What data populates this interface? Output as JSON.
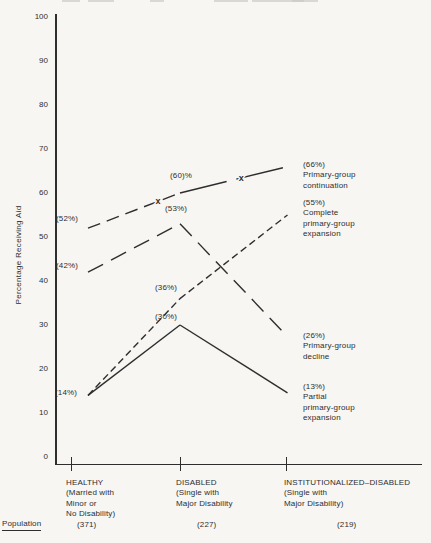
{
  "colors": {
    "ink": "#2e2e2e",
    "paper": "#f7f6f3"
  },
  "chart_data": {
    "type": "line",
    "title": "",
    "xlabel": "",
    "ylabel": "Percentage Receiving Aid",
    "ylim": [
      0,
      100
    ],
    "grid": false,
    "legend_position": "right-of-line-ends",
    "yticks": [
      "100",
      "90",
      "80",
      "70",
      "60",
      "50",
      "40",
      "30",
      "20",
      "10",
      "0"
    ],
    "marker_glyph": "x",
    "categories": [
      {
        "label": "HEALTHY",
        "sublines": [
          "(Married with",
          "Minor or",
          "No Disability)"
        ],
        "population": "(371)"
      },
      {
        "label": "DISABLED",
        "sublines": [
          "(Single with",
          "Major Disability"
        ],
        "population": "(227)"
      },
      {
        "label": "INSTITUTIONALIZED–DISABLED",
        "sublines": [
          "(Single with",
          "Major Disability)"
        ],
        "population": "(219)"
      }
    ],
    "population_row_label": "Population",
    "series": [
      {
        "name": "Primary-group continuation",
        "values": [
          52,
          60,
          66
        ],
        "line_style": "dash-then-solid",
        "has_x_markers": true,
        "end_label_lines": [
          "(66%)",
          "Primary-group",
          "continuation"
        ]
      },
      {
        "name": "Complete primary-group expansion",
        "values": [
          14,
          36,
          55
        ],
        "line_style": "short-dash",
        "has_x_markers": false,
        "end_label_lines": [
          "(55%)",
          "Complete",
          "primary-group",
          "expansion"
        ]
      },
      {
        "name": "Primary-group decline",
        "values": [
          42,
          53,
          26
        ],
        "line_style": "long-dash",
        "has_x_markers": false,
        "end_label_lines": [
          "(26%)",
          "Primary-group",
          "decline"
        ]
      },
      {
        "name": "Partial primary-group expansion",
        "values": [
          14,
          30,
          13
        ],
        "line_style": "solid",
        "has_x_markers": false,
        "end_label_lines": [
          "(13%)",
          "Partial",
          "primary-group",
          "expansion"
        ]
      }
    ],
    "point_labels": {
      "continuation_healthy": "(52%)",
      "continuation_disabled": "(60)%",
      "decline_healthy": "(42%)",
      "decline_disabled": "(53%)",
      "expansion_start": "(14%)",
      "complete_disabled": "(36%)",
      "partial_disabled": "(30%)"
    }
  }
}
